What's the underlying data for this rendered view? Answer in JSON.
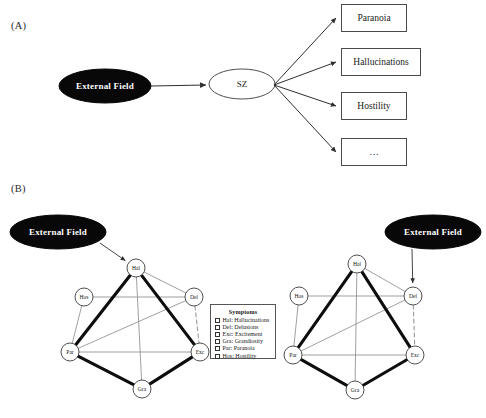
{
  "figure": {
    "panels": [
      {
        "id": "A",
        "label": "(A)"
      },
      {
        "id": "B",
        "label": "(B)"
      }
    ]
  },
  "panel_a": {
    "external_field": {
      "label": "External Field",
      "cx": 105,
      "cy": 86,
      "rx": 46,
      "ry": 17,
      "fill": "#080808"
    },
    "disorder": {
      "label": "SZ",
      "cx": 242,
      "cy": 84,
      "rx": 33,
      "ry": 15,
      "fill": "#ffffff",
      "stroke": "#3a3a3a"
    },
    "outcomes": [
      {
        "label": "Paranoia",
        "x": 341,
        "y": 4,
        "w": 66,
        "h": 28
      },
      {
        "label": "Hallucinations",
        "x": 341,
        "y": 48,
        "w": 80,
        "h": 28
      },
      {
        "label": "Hostility",
        "x": 341,
        "y": 92,
        "w": 66,
        "h": 28
      },
      {
        "label": "…",
        "x": 341,
        "y": 138,
        "w": 66,
        "h": 28
      }
    ]
  },
  "panel_b": {
    "external_field_label": "External Field",
    "networks": [
      {
        "name": "network-left",
        "external_field": {
          "cx": 58,
          "cy": 232,
          "rx": 48,
          "ry": 17,
          "fill": "#080808"
        },
        "target_node": "Hal",
        "arrow": {
          "x1": 100,
          "y1": 243,
          "x2": 126,
          "y2": 263
        },
        "nodes": [
          {
            "id": "Hal",
            "label": "Hal",
            "cx": 136,
            "cy": 268,
            "r": 9
          },
          {
            "id": "Hos",
            "label": "Hos",
            "cx": 84,
            "cy": 297,
            "r": 9
          },
          {
            "id": "Del",
            "label": "Del",
            "cx": 194,
            "cy": 297,
            "r": 9
          },
          {
            "id": "Par",
            "label": "Par",
            "cx": 70,
            "cy": 352,
            "r": 9
          },
          {
            "id": "Exc",
            "label": "Exc",
            "cx": 200,
            "cy": 352,
            "r": 9
          },
          {
            "id": "Gra",
            "label": "Gra",
            "cx": 142,
            "cy": 389,
            "r": 9
          }
        ]
      },
      {
        "name": "network-right",
        "external_field": {
          "cx": 433,
          "cy": 232,
          "rx": 48,
          "ry": 17,
          "fill": "#080808"
        },
        "target_node": "Del",
        "arrow": {
          "x1": 412,
          "y1": 249,
          "x2": 387,
          "y2": 293
        },
        "nodes": [
          {
            "id": "Hal",
            "label": "Hal",
            "cx": 357,
            "cy": 264,
            "r": 9
          },
          {
            "id": "Hos",
            "label": "Hos",
            "cx": 299,
            "cy": 296,
            "r": 9
          },
          {
            "id": "Del",
            "label": "Del",
            "cx": 413,
            "cy": 296,
            "r": 9
          },
          {
            "id": "Par",
            "label": "Par",
            "cx": 293,
            "cy": 355,
            "r": 9
          },
          {
            "id": "Exc",
            "label": "Exc",
            "cx": 415,
            "cy": 355,
            "r": 9
          },
          {
            "id": "Gra",
            "label": "Gra",
            "cx": 355,
            "cy": 390,
            "r": 9
          }
        ]
      }
    ],
    "edges": [
      {
        "from": "Hal",
        "to": "Par",
        "style": "thick"
      },
      {
        "from": "Hal",
        "to": "Exc",
        "style": "thick"
      },
      {
        "from": "Par",
        "to": "Gra",
        "style": "thick"
      },
      {
        "from": "Gra",
        "to": "Exc",
        "style": "thick"
      },
      {
        "from": "Hal",
        "to": "Del",
        "style": "thin"
      },
      {
        "from": "Hal",
        "to": "Gra",
        "style": "thin"
      },
      {
        "from": "Hos",
        "to": "Del",
        "style": "thin"
      },
      {
        "from": "Hos",
        "to": "Par",
        "style": "thin"
      },
      {
        "from": "Par",
        "to": "Exc",
        "style": "thin"
      },
      {
        "from": "Par",
        "to": "Del",
        "style": "thin"
      },
      {
        "from": "Del",
        "to": "Exc",
        "style": "dashed"
      }
    ],
    "legend": {
      "title": "Symptoms",
      "x": 210,
      "y": 304,
      "w": 66,
      "h": 55,
      "items": [
        {
          "abbr": "Hal",
          "name": "Hallucinations",
          "text": "Hal: Hallucinations"
        },
        {
          "abbr": "Del",
          "name": "Delusions",
          "text": "Del: Delusions"
        },
        {
          "abbr": "Exc",
          "name": "Excitement",
          "text": "Exc: Excitement"
        },
        {
          "abbr": "Gra",
          "name": "Grandiosity",
          "text": "Gra: Grandiosity"
        },
        {
          "abbr": "Par",
          "name": "Paranoia",
          "text": "Par: Paranoia"
        },
        {
          "abbr": "Hos",
          "name": "Hostility",
          "text": "Hos: Hostility"
        }
      ]
    }
  },
  "style": {
    "thick_edge_color": "#0d0d0d",
    "thin_edge_color": "#8f8f8f",
    "dashed_edge_color": "#9a9a9a",
    "node_stroke": "#3c3c3c",
    "node_fill": "#ffffff",
    "arrow_color": "#2f2f2f",
    "box_stroke": "#4a4a4a"
  }
}
